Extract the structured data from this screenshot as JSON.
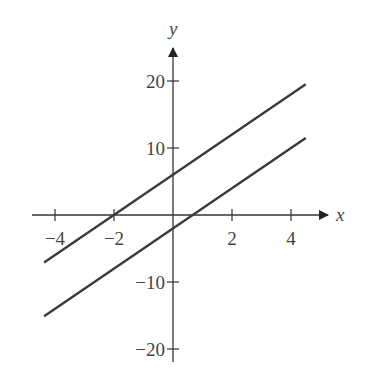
{
  "chart_data": {
    "type": "line",
    "title": "",
    "xlabel": "x",
    "ylabel": "y",
    "xlim": [
      -4.4,
      5
    ],
    "ylim": [
      -23,
      27
    ],
    "grid": false,
    "legend": null,
    "x_ticks": [
      -4,
      -2,
      2,
      4
    ],
    "x_tick_labels": [
      "−4",
      "−2",
      "2",
      "4"
    ],
    "y_ticks": [
      20,
      10,
      -10,
      -20
    ],
    "y_tick_labels": [
      "20",
      "10",
      "−10",
      "−20"
    ],
    "series": [
      {
        "name": "upper line",
        "equation": "y = 3x + 6",
        "x": [
          -4.37,
          4.5
        ],
        "y": [
          -7.1,
          19.5
        ],
        "color": "#3a3a3a"
      },
      {
        "name": "lower line",
        "equation": "y = 3x - 2",
        "x": [
          -4.37,
          4.5
        ],
        "y": [
          -15.1,
          11.5
        ],
        "color": "#3a3a3a"
      }
    ]
  },
  "axis_color": "#333333"
}
